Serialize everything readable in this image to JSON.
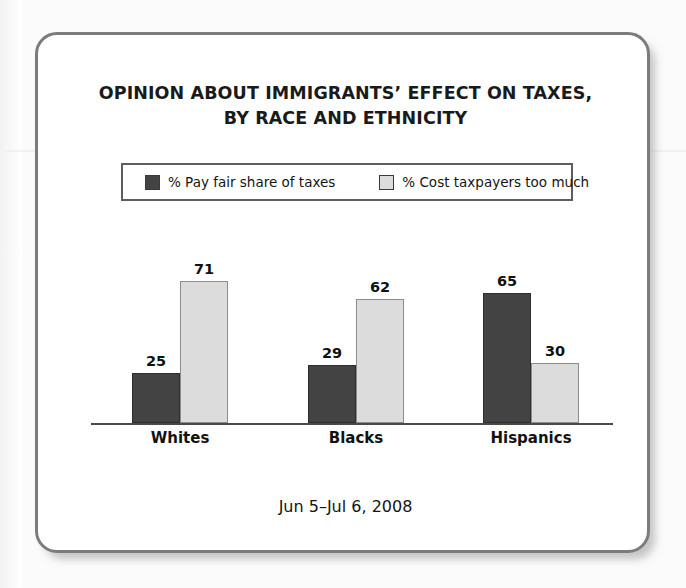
{
  "card": {
    "title_line_1": "OPINION ABOUT IMMIGRANTS’ EFFECT ON TAXES,",
    "title_line_2": "BY RACE AND ETHNICITY",
    "footer": "Jun 5–Jul 6, 2008"
  },
  "legend": {
    "items": [
      {
        "label": "% Pay fair share of taxes",
        "color": "#434343"
      },
      {
        "label": "% Cost taxpayers too much",
        "color": "#dcdcdc"
      }
    ]
  },
  "chart_data": {
    "type": "bar",
    "title": "OPINION ABOUT IMMIGRANTS’ EFFECT ON TAXES, BY RACE AND ETHNICITY",
    "subtitle": "Jun 5–Jul 6, 2008",
    "xlabel": "",
    "ylabel": "",
    "ylim": [
      0,
      100
    ],
    "grid": false,
    "legend_position": "top",
    "categories": [
      "Whites",
      "Blacks",
      "Hispanics"
    ],
    "series": [
      {
        "name": "% Pay fair share of taxes",
        "color": "#434343",
        "values": [
          25,
          29,
          65
        ]
      },
      {
        "name": "% Cost taxpayers too much",
        "color": "#dcdcdc",
        "values": [
          71,
          62,
          30
        ]
      }
    ]
  }
}
